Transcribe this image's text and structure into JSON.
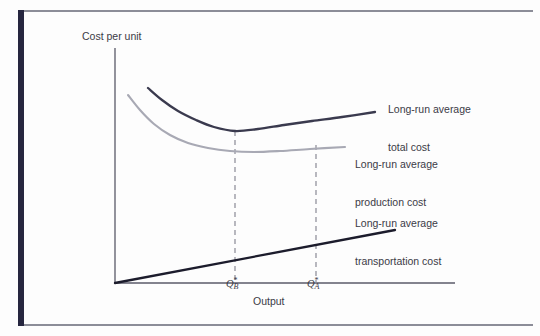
{
  "figure": {
    "background_color": "#fdfdfd",
    "frame_accent_color": "#26263f",
    "frame_rule_color": "#8c8d98"
  },
  "chart_data": {
    "type": "line",
    "title": "",
    "xlabel": "Output",
    "ylabel": "Cost per unit",
    "grid": false,
    "legend_position": "right-inline-annotations",
    "axis": {
      "x_origin_px": 115,
      "y_origin_px": 283,
      "x_end_px": 455,
      "y_top_px": 48,
      "x_range_label": "Output (no numeric ticks)",
      "y_range_label": "Cost per unit (no numeric ticks)"
    },
    "annotations": [
      {
        "id": "q-star-b",
        "text": "Q*B",
        "base": "Q",
        "superscript": "*",
        "subscript": "B",
        "x_px": 235,
        "meaning": "output level minimizing long-run average production cost"
      },
      {
        "id": "q-star-a",
        "text": "Q*A",
        "base": "Q",
        "superscript": "*",
        "subscript": "A",
        "x_px": 316,
        "meaning": "output level minimizing long-run average total cost"
      }
    ],
    "dashed_guides": [
      {
        "id": "guide-qb",
        "x_px": 235,
        "y_top_px": 131,
        "y_bottom_px": 283
      },
      {
        "id": "guide-qa",
        "x_px": 316,
        "y_top_px": 145,
        "y_bottom_px": 283
      }
    ],
    "series": [
      {
        "name": "Long-run average total cost",
        "label_line1": "Long-run average",
        "label_line2": "total cost",
        "color": "#3a3a4e",
        "width": 2.3,
        "style": "solid",
        "shape": "u-shaped (declines then rises)",
        "points": [
          [
            148,
            88
          ],
          [
            162,
            100
          ],
          [
            178,
            111
          ],
          [
            196,
            120
          ],
          [
            214,
            127
          ],
          [
            235,
            131
          ],
          [
            258,
            129
          ],
          [
            284,
            125
          ],
          [
            312,
            121
          ],
          [
            342,
            117
          ],
          [
            375,
            112
          ]
        ]
      },
      {
        "name": "Long-run average production cost",
        "label_line1": "Long-run average",
        "label_line2": "production cost",
        "color": "#a8a9b4",
        "width": 2.1,
        "style": "solid",
        "shape": "decreasing, flattening (economies of scale)",
        "points": [
          [
            128,
            95
          ],
          [
            140,
            110
          ],
          [
            154,
            124
          ],
          [
            170,
            135
          ],
          [
            188,
            143
          ],
          [
            208,
            148
          ],
          [
            230,
            151
          ],
          [
            254,
            152
          ],
          [
            280,
            151
          ],
          [
            310,
            149
          ],
          [
            345,
            147
          ]
        ]
      },
      {
        "name": "Long-run average transportation cost",
        "label_line1": "Long-run average",
        "label_line2": "transportation cost",
        "color": "#1c1c2c",
        "width": 2.3,
        "style": "solid",
        "shape": "linear increasing from origin",
        "points": [
          [
            115,
            283
          ],
          [
            395,
            230
          ]
        ]
      }
    ]
  }
}
